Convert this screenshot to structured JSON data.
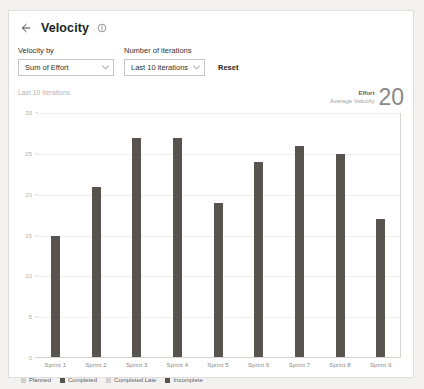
{
  "header": {
    "back_icon": "arrow-left-icon",
    "title": "Velocity",
    "info_icon": "info-circle-icon"
  },
  "controls": {
    "velocity_by": {
      "label": "Velocity by",
      "value": "Sum of Effort",
      "caret_icon": "chevron-down-icon"
    },
    "iterations": {
      "label": "Number of iterations",
      "value": "Last 10 iterations",
      "caret_icon": "chevron-down-icon"
    },
    "reset_label": "Reset"
  },
  "chart_meta": {
    "range_caption": "Last 10 iterations",
    "summary_metric": "Effort",
    "summary_sublabel": "Average Velocity",
    "summary_value": "20"
  },
  "colors": {
    "bar": "#57534f",
    "planned": "#d2d0ce",
    "completed": "#57534f",
    "completed_late": "#d2d0ce",
    "incomplete": "#57534f",
    "card_border": "#e1dfdd",
    "page_background": "#f3f2f1"
  },
  "legend": [
    {
      "label": "Planned",
      "color": "#d2d0ce"
    },
    {
      "label": "Completed",
      "color": "#57534f"
    },
    {
      "label": "Completed Late",
      "color": "#d2d0ce"
    },
    {
      "label": "Incomplete",
      "color": "#57534f"
    }
  ],
  "chart_data": {
    "type": "bar",
    "title": "Velocity",
    "xlabel": "",
    "ylabel": "",
    "categories": [
      "Sprint 1",
      "Sprint 2",
      "Sprint 3",
      "Sprint 4",
      "Sprint 5",
      "Sprint 6",
      "Sprint 7",
      "Sprint 8",
      "Sprint 9"
    ],
    "series": [
      {
        "name": "Completed",
        "values": [
          15,
          21,
          27,
          27,
          19,
          24,
          26,
          25,
          17
        ]
      }
    ],
    "ylim": [
      0,
      30
    ],
    "yticks": [
      0,
      5,
      10,
      15,
      20,
      25,
      30
    ],
    "ytick_labels": [
      "0",
      "5",
      "10",
      "15",
      "20",
      "25",
      "30"
    ],
    "grid": true,
    "legend_position": "bottom-left"
  }
}
